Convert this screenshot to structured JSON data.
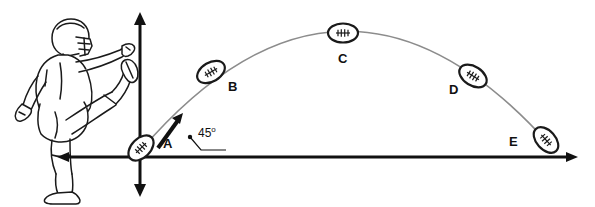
{
  "diagram": {
    "background_color": "#ffffff",
    "axis_color": "#111111",
    "trajectory_color": "#8c8c8c",
    "ball_color": "#ffffff",
    "ball_outline_color": "#1a1a1a",
    "figure_color": "#1a1a1a"
  },
  "axes": {
    "origin_x": 140,
    "origin_y": 157,
    "x_axis_label": "",
    "y_axis_label": "",
    "x_axis_start": 57,
    "x_axis_end": 578,
    "y_axis_top": 12,
    "y_axis_bottom": 197
  },
  "velocity_vector": {
    "label": "",
    "angle_text": "45",
    "degree_symbol": "o",
    "angle_full_text": "45o",
    "start_x": 158,
    "start_y": 148,
    "end_x": 183,
    "end_y": 114
  },
  "points": [
    {
      "label": "A",
      "x": 141,
      "y": 148,
      "label_x": 163,
      "label_y": 137,
      "tilt": -45
    },
    {
      "label": "B",
      "x": 211,
      "y": 72,
      "label_x": 228,
      "label_y": 80,
      "tilt": -30
    },
    {
      "label": "C",
      "x": 343,
      "y": 33,
      "label_x": 338,
      "label_y": 52,
      "tilt": 0
    },
    {
      "label": "D",
      "x": 473,
      "y": 76,
      "label_x": 449,
      "label_y": 83,
      "tilt": 32
    },
    {
      "label": "E",
      "x": 546,
      "y": 140,
      "label_x": 509,
      "label_y": 135,
      "tilt": 48
    }
  ],
  "trajectory": {
    "type": "parabola",
    "start": {
      "x": 141,
      "y": 150
    },
    "apex": {
      "x": 343,
      "y": 33
    },
    "end": {
      "x": 548,
      "y": 143
    }
  },
  "player": {
    "name": "football-kicker",
    "description": "football player in helmet kicking ball"
  }
}
